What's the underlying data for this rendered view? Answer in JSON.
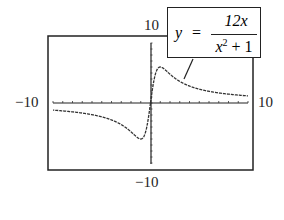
{
  "chart_data": {
    "type": "line",
    "title": "",
    "function": "y = 12x / (x^2 + 1)",
    "annotation": {
      "y_label": "y",
      "equals": "=",
      "numerator": "12x",
      "denominator_base": "x",
      "denominator_exp": "2",
      "denominator_rest": " + 1"
    },
    "xlim": [
      -10,
      10
    ],
    "ylim": [
      -10,
      10
    ],
    "x_tick_labels": {
      "min": "−10",
      "max": "10"
    },
    "y_tick_labels": {
      "min": "−10",
      "max": "10"
    },
    "x_ticks_step": 1,
    "y_ticks_step": 1,
    "grid": false,
    "series": [
      {
        "name": "12x/(x^2+1)",
        "x": [
          -10,
          -8,
          -6,
          -4,
          -3,
          -2,
          -1.5,
          -1,
          -0.5,
          0,
          0.5,
          1,
          1.5,
          2,
          3,
          4,
          6,
          8,
          10
        ],
        "values": [
          -1.19,
          -1.48,
          -1.95,
          -2.82,
          -3.6,
          -4.8,
          -5.54,
          -6.0,
          -4.8,
          0,
          4.8,
          6.0,
          5.54,
          4.8,
          3.6,
          2.82,
          1.95,
          1.48,
          1.19
        ]
      }
    ]
  }
}
